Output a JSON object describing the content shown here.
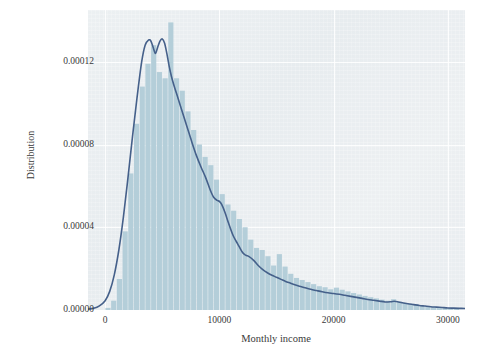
{
  "chart_data": {
    "type": "bar",
    "title": "",
    "subtitle": "",
    "xlabel": "Monthly income",
    "ylabel": "Distribution",
    "xlim": [
      -1500,
      31500
    ],
    "ylim": [
      0,
      0.000145
    ],
    "xticks": [
      0,
      10000,
      20000,
      30000
    ],
    "xtick_labels": [
      "0",
      "10000",
      "20000",
      "30000"
    ],
    "yticks": [
      0.0,
      4e-05,
      8e-05,
      0.00012
    ],
    "ytick_labels": [
      "0.00000",
      "0.00004",
      "0.00008",
      "0.00012"
    ],
    "grid": true,
    "legend": null,
    "bin_width": 500,
    "series": [
      {
        "name": "histogram",
        "kind": "bar",
        "color": "#b4ced9",
        "x": [
          250,
          750,
          1250,
          1750,
          2250,
          2750,
          3250,
          3750,
          4250,
          4750,
          5250,
          5750,
          6250,
          6750,
          7250,
          7750,
          8250,
          8750,
          9250,
          9750,
          10250,
          10750,
          11250,
          11750,
          12250,
          12750,
          13250,
          13750,
          14250,
          14750,
          15250,
          15750,
          16250,
          16750,
          17250,
          17750,
          18250,
          18750,
          19250,
          19750,
          20250,
          20750,
          21250,
          21750,
          22250,
          22750,
          23250,
          23750,
          24250,
          24750,
          25250,
          25750,
          26250,
          26750,
          27250,
          27750,
          28250,
          28750,
          29250,
          29750,
          30250,
          30750
        ],
        "values": [
          1e-06,
          4.5e-06,
          1.5e-05,
          3.8e-05,
          6.6e-05,
          9e-05,
          0.000108,
          0.000119,
          0.000128,
          0.000115,
          0.000112,
          0.000139,
          0.000112,
          0.000106,
          9.6e-05,
          8.7e-05,
          8e-05,
          7.4e-05,
          7e-05,
          6.3e-05,
          5.6e-05,
          5.1e-05,
          4.8e-05,
          4.4e-05,
          4e-05,
          3.4e-05,
          3e-05,
          2.9e-05,
          2.6e-05,
          2.15e-05,
          2.7e-05,
          2.1e-05,
          1.75e-05,
          1.55e-05,
          1.45e-05,
          1.35e-05,
          1.25e-05,
          1.15e-05,
          1.1e-05,
          1e-05,
          1.08e-05,
          9.8e-06,
          9e-06,
          8.2e-06,
          7.5e-06,
          6.8e-06,
          6.2e-06,
          5.6e-06,
          5e-06,
          4.5e-06,
          5.2e-06,
          4e-06,
          3.4e-06,
          3e-06,
          2.6e-06,
          2.2e-06,
          1.9e-06,
          1.6e-06,
          1.3e-06,
          1.1e-06,
          9e-07,
          7e-07
        ]
      },
      {
        "name": "kde",
        "kind": "line",
        "color": "#45608a",
        "x": [
          -1500,
          -1000,
          -500,
          0,
          400,
          800,
          1200,
          1600,
          2000,
          2400,
          2800,
          3200,
          3500,
          3800,
          4000,
          4200,
          4400,
          4600,
          4800,
          5000,
          5200,
          5400,
          5600,
          5800,
          6000,
          6400,
          6800,
          7200,
          7600,
          8000,
          8400,
          8800,
          9200,
          9500,
          9800,
          10000,
          10200,
          10500,
          10800,
          11200,
          11600,
          12000,
          12300,
          12600,
          13000,
          13400,
          13800,
          14200,
          14600,
          15000,
          15400,
          15800,
          16200,
          16600,
          17000,
          17500,
          18000,
          18500,
          19000,
          19500,
          20000,
          20500,
          21000,
          21500,
          22000,
          22500,
          23000,
          23500,
          24000,
          24500,
          25000,
          25300,
          25600,
          26000,
          26500,
          27000,
          27500,
          28000,
          28500,
          29000,
          29500,
          30000,
          30500,
          31000,
          31500
        ],
        "values": [
          4e-07,
          8e-07,
          2e-06,
          4.5e-06,
          9e-06,
          1.7e-05,
          2.9e-05,
          4.5e-05,
          6.4e-05,
          8.4e-05,
          0.000103,
          0.00012,
          0.000128,
          0.0001305,
          0.00013,
          0.000127,
          0.000124,
          0.000127,
          0.00013,
          0.000131,
          0.000129,
          0.000124,
          0.000118,
          0.000113,
          0.000109,
          0.000102,
          9.5e-05,
          8.8e-05,
          8.1e-05,
          7.45e-05,
          6.9e-05,
          6.4e-05,
          5.8e-05,
          5.45e-05,
          5.3e-05,
          5.25e-05,
          5.1e-05,
          4.7e-05,
          4.2e-05,
          3.6e-05,
          3.2e-05,
          2.8e-05,
          2.65e-05,
          2.58e-05,
          2.4e-05,
          2.15e-05,
          1.95e-05,
          1.8e-05,
          1.68e-05,
          1.58e-05,
          1.48e-05,
          1.38e-05,
          1.3e-05,
          1.22e-05,
          1.15e-05,
          1.08e-05,
          1e-05,
          9.4e-06,
          8.8e-06,
          8.3e-06,
          8e-06,
          7.6e-06,
          7.1e-06,
          6.6e-06,
          6.1e-06,
          5.6e-06,
          5.1e-06,
          4.7e-06,
          4.3e-06,
          3.9e-06,
          4e-06,
          4.2e-06,
          4e-06,
          3.5e-06,
          3e-06,
          2.6e-06,
          2.2e-06,
          1.9e-06,
          1.6e-06,
          1.4e-06,
          1.2e-06,
          1e-06,
          9e-07,
          8e-07,
          7e-07
        ]
      }
    ]
  }
}
